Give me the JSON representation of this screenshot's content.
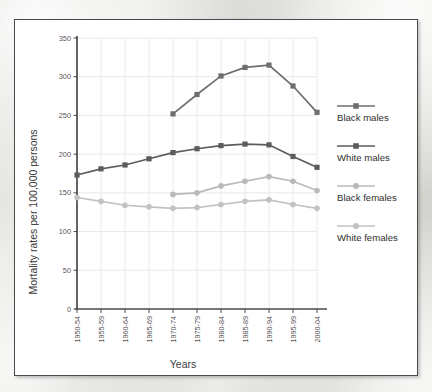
{
  "chart_data": {
    "type": "line",
    "title": "",
    "xlabel": "Years",
    "ylabel": "Mortality rates per 100,000 persons",
    "categories": [
      "1950-54",
      "1955-59",
      "1960-64",
      "1965-69",
      "1970-74",
      "1975-79",
      "1980-84",
      "1985-89",
      "1990-94",
      "1995-99",
      "2000-04"
    ],
    "ylim": [
      0,
      350
    ],
    "yticks": [
      0,
      50,
      100,
      150,
      200,
      250,
      300,
      350
    ],
    "ytick_labels": [
      "0",
      "50",
      "100",
      "150",
      "200",
      "250",
      "300",
      "350"
    ],
    "grid": true,
    "legend_position": "right",
    "series": [
      {
        "name": "Black males",
        "color": "#6e6e6e",
        "marker": "square",
        "values": [
          null,
          null,
          null,
          null,
          252,
          277,
          301,
          312,
          315,
          288,
          254
        ]
      },
      {
        "name": "White males",
        "color": "#5c5c5c",
        "marker": "square",
        "values": [
          173,
          181,
          186,
          194,
          202,
          207,
          211,
          213,
          212,
          197,
          183
        ]
      },
      {
        "name": "Black females",
        "color": "#b9b9b9",
        "marker": "circle",
        "values": [
          null,
          null,
          null,
          null,
          148,
          150,
          159,
          165,
          171,
          165,
          153
        ]
      },
      {
        "name": "White females",
        "color": "#c2c2c2",
        "marker": "circle",
        "values": [
          144,
          139,
          134,
          132,
          130,
          131,
          135,
          139,
          141,
          135,
          130
        ]
      }
    ]
  },
  "legend": {
    "entries": [
      {
        "label": "Black males"
      },
      {
        "label": "White males"
      },
      {
        "label": "Black females"
      },
      {
        "label": "White females"
      }
    ]
  },
  "axes": {
    "y_title": "Mortality rates per 100,000 persons",
    "x_title": "Years"
  },
  "colors": {
    "panel_background": "#ffffff",
    "panel_border": "#4a4a4a",
    "grid": "#e3e3e3",
    "axis": "#4a4a4a",
    "dark_series": "#5c5c5c",
    "black_males": "#6e6e6e",
    "light_series": "#bfbfbf"
  }
}
